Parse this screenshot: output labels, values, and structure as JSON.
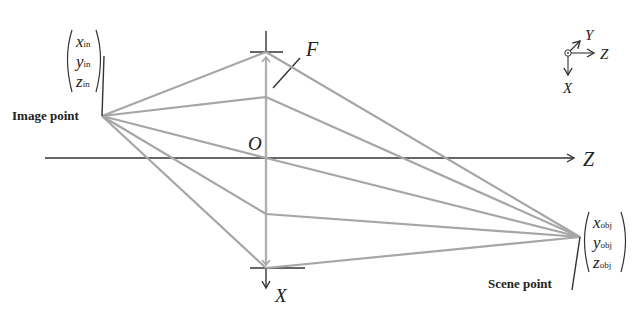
{
  "diagram": {
    "type": "thin-lens ray diagram",
    "labels": {
      "focal": "F",
      "origin": "O",
      "optical_axis": "Z",
      "lens_axis": "X",
      "image_point": "Image point",
      "scene_point": "Scene point"
    },
    "image_vector": {
      "x": "x",
      "x_sub": "in",
      "y": "y",
      "y_sub": "in",
      "z": "z",
      "z_sub": "in"
    },
    "scene_vector": {
      "x": "x",
      "x_sub": "obj",
      "y": "y",
      "y_sub": "obj",
      "z": "z",
      "z_sub": "obj"
    },
    "coordinate_frame": {
      "y_label": "Y",
      "z_label": "Z",
      "x_label": "X"
    },
    "colors": {
      "rays": "#a6a6a6",
      "axes": "#333333",
      "text": "#222222"
    }
  }
}
